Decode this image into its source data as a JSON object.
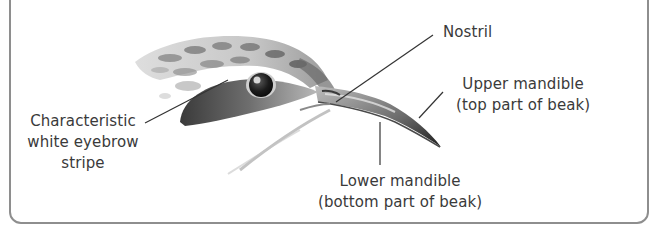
{
  "diagram": {
    "colors": {
      "border": "#8e8e8e",
      "text": "#3a3a3a",
      "leader_line": "#333333",
      "background": "#ffffff"
    },
    "labels": {
      "eyebrow": {
        "lines": [
          "Characteristic",
          "white eyebrow",
          "stripe"
        ]
      },
      "nostril": {
        "lines": [
          "Nostril"
        ]
      },
      "upper_mandible": {
        "lines": [
          "Upper mandible",
          "(top part of beak)"
        ]
      },
      "lower_mandible": {
        "lines": [
          "Lower mandible",
          "(bottom part of beak)"
        ]
      }
    }
  }
}
